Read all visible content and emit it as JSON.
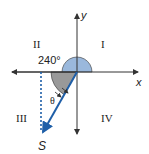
{
  "diagram": {
    "axes": {
      "x_label": "x",
      "y_label": "y"
    },
    "quadrants": [
      "I",
      "II",
      "III",
      "IV"
    ],
    "angle_label": "240°",
    "theta_label": "θ",
    "vector_label": "S",
    "colors": {
      "vector": "#1f5fa8",
      "angle_fill": "#9ab8dc",
      "theta_fill": "#999999",
      "axis": "#333333"
    }
  }
}
